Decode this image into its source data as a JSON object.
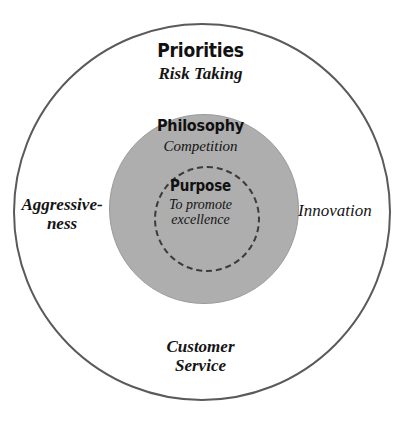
{
  "diagram": {
    "type": "concentric-circles",
    "title": "",
    "colors": {
      "outer_ring_stroke": "#5a5a5a",
      "middle_ring_fill": "#aeaeae",
      "inner_ring_stroke": "#3b3b3b",
      "background": "#ffffff",
      "text": "#141414"
    },
    "layers": [
      {
        "name": "priorities",
        "heading": "Priorities",
        "value": "Risk Taking",
        "value_lines": [
          "Risk Taking"
        ]
      },
      {
        "name": "philosophy",
        "heading": "Philosophy",
        "value": "Competition",
        "value_lines": [
          "Competition"
        ]
      },
      {
        "name": "purpose",
        "heading": "Purpose",
        "value": "To promote excellence",
        "value_lines": [
          "To promote",
          "excellence"
        ]
      }
    ],
    "outer_labels": [
      {
        "name": "aggressiveness",
        "value": "Aggressiveness",
        "value_lines": [
          "Aggressive-",
          "ness"
        ],
        "position": "left"
      },
      {
        "name": "innovation",
        "value": "Innovation",
        "value_lines": [
          "Innovation"
        ],
        "position": "right"
      },
      {
        "name": "customer-service",
        "value": "Customer Service",
        "value_lines": [
          "Customer",
          "Service"
        ],
        "position": "bottom"
      }
    ]
  }
}
